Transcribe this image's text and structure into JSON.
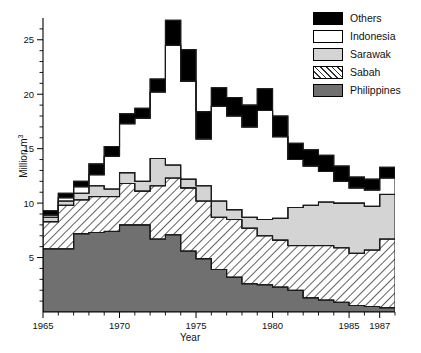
{
  "chart_data": {
    "type": "area",
    "subtype": "stacked-step-area",
    "title": "",
    "xlabel": "Year",
    "ylabel": "Million m3",
    "ylabel_html": "Million m<sup>3</sup>",
    "xlim": [
      1965,
      1988
    ],
    "ylim": [
      0,
      27
    ],
    "yticks": [
      5,
      10,
      15,
      20,
      25
    ],
    "ytick_minor_step": 1,
    "xticks": [
      1965,
      1970,
      1975,
      1980,
      1985,
      1987
    ],
    "xtick_minor_step": 1,
    "grid": false,
    "legend_position": "top-right",
    "x": [
      1965,
      1966,
      1967,
      1968,
      1969,
      1970,
      1971,
      1972,
      1973,
      1974,
      1975,
      1976,
      1977,
      1978,
      1979,
      1980,
      1981,
      1982,
      1983,
      1984,
      1985,
      1986,
      1987
    ],
    "series": [
      {
        "name": "Philippines",
        "color": "#707070",
        "values": [
          5.8,
          5.8,
          7.2,
          7.3,
          7.4,
          8.0,
          8.0,
          6.7,
          7.1,
          5.6,
          4.9,
          3.9,
          3.2,
          2.6,
          2.5,
          2.3,
          2.0,
          1.3,
          1.1,
          0.9,
          0.6,
          0.5,
          0.4
        ]
      },
      {
        "name": "Sabah",
        "color": "#ffffff",
        "hatch": "45-degree",
        "values": [
          2.5,
          4.0,
          3.1,
          3.3,
          3.2,
          3.8,
          3.1,
          4.9,
          5.2,
          5.8,
          5.3,
          4.8,
          5.3,
          5.1,
          4.5,
          4.3,
          4.1,
          4.8,
          5.0,
          5.0,
          4.8,
          5.2,
          6.3
        ]
      },
      {
        "name": "Sarawak",
        "color": "#d4d4d4",
        "values": [
          0.4,
          0.4,
          0.6,
          1.0,
          0.7,
          1.0,
          0.9,
          2.5,
          1.2,
          0.8,
          1.4,
          1.5,
          0.9,
          1.0,
          1.5,
          2.0,
          3.5,
          3.7,
          4.0,
          4.1,
          4.6,
          4.0,
          4.1
        ]
      },
      {
        "name": "Indonesia",
        "color": "#ffffff",
        "values": [
          0.2,
          0.3,
          0.6,
          1.0,
          3.0,
          4.5,
          5.8,
          6.1,
          11.0,
          9.0,
          4.3,
          8.7,
          8.6,
          8.3,
          10.0,
          7.5,
          4.4,
          3.6,
          2.8,
          2.0,
          1.4,
          1.5,
          1.5
        ]
      },
      {
        "name": "Others",
        "color": "#000000",
        "values": [
          0.4,
          0.4,
          0.5,
          1.0,
          0.9,
          0.9,
          0.9,
          1.2,
          2.3,
          2.9,
          2.5,
          1.7,
          1.7,
          2.0,
          2.0,
          1.9,
          1.5,
          1.5,
          1.5,
          1.4,
          1.0,
          1.0,
          1.0
        ]
      }
    ],
    "totals": [
      9.3,
      10.9,
      12.0,
      13.6,
      15.2,
      18.2,
      18.7,
      21.4,
      26.8,
      24.1,
      18.4,
      20.6,
      19.7,
      19.0,
      20.5,
      18.0,
      15.5,
      14.9,
      14.4,
      13.4,
      12.4,
      12.2,
      13.3
    ]
  },
  "legend": {
    "items": [
      {
        "label": "Others",
        "swatch": "sw-others"
      },
      {
        "label": "Indonesia",
        "swatch": "sw-indonesia"
      },
      {
        "label": "Sarawak",
        "swatch": "sw-sarawak"
      },
      {
        "label": "Sabah",
        "swatch": "sw-sabah"
      },
      {
        "label": "Philippines",
        "swatch": "sw-philippines"
      }
    ]
  },
  "axes": {
    "x_title": "Year",
    "x_tick_labels": [
      "1965",
      "1970",
      "1975",
      "1980",
      "1985",
      "1987"
    ],
    "y_tick_labels": [
      "5",
      "10",
      "15",
      "20",
      "25"
    ]
  },
  "colors": {
    "others": "#000000",
    "indonesia": "#ffffff",
    "sarawak": "#d4d4d4",
    "sabah_line": "#333333",
    "philippines": "#707070",
    "axis": "#000000"
  }
}
